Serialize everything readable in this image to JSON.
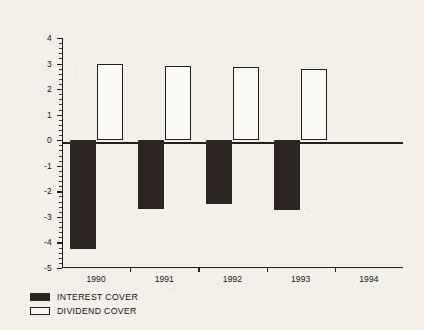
{
  "chart_data": {
    "type": "bar",
    "title": "",
    "subtitle": "",
    "xlabel": "",
    "ylabel": "",
    "categories": [
      "1990",
      "1991",
      "1992",
      "1993",
      "1994"
    ],
    "series": [
      {
        "name": "INTEREST COVER",
        "color": "#2b2420",
        "style": "filled",
        "values": [
          -4.25,
          -2.7,
          -2.5,
          -2.75,
          null
        ]
      },
      {
        "name": "DIVIDEND COVER",
        "color": "#fbf9f4",
        "style": "outlined",
        "values": [
          3.0,
          2.9,
          2.88,
          2.78,
          null
        ]
      }
    ],
    "ylim": [
      -5,
      4
    ],
    "ytick_labels": [
      "4",
      "3",
      "2",
      "1",
      "0",
      "-1",
      "-2",
      "-3",
      "-4",
      "-5"
    ],
    "ytick_values": [
      4,
      3,
      2,
      1,
      0,
      -1,
      -2,
      -3,
      -4,
      -5
    ],
    "minor_ticks_per_interval": 4,
    "grid": false,
    "zero_line": true,
    "legend_position": "below-left",
    "legend": [
      {
        "label": "INTEREST COVER",
        "swatch": "filled"
      },
      {
        "label": "DIVIDEND COVER",
        "swatch": "outlined"
      }
    ]
  },
  "figure": {
    "background_color": "#f3f0ea",
    "axis_color": "#241f1c"
  }
}
